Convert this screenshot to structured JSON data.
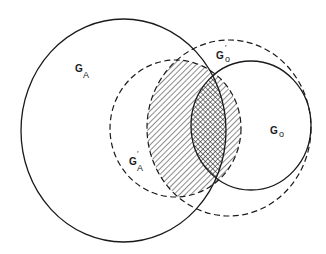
{
  "diagram": {
    "type": "set-overlap",
    "colors": {
      "stroke": "#1a1a1a",
      "background": "#ffffff"
    },
    "sets": [
      {
        "id": "G_A",
        "main": "G",
        "sub": "A",
        "prime": "",
        "style": "solid",
        "cx": 123.5,
        "cy": 130.5,
        "rx": 102.5,
        "ry": 111.5
      },
      {
        "id": "G_A_prime",
        "main": "G",
        "sub": "A",
        "prime": "′",
        "style": "dashed",
        "cx": 175.5,
        "cy": 128.5,
        "rx": 65.5,
        "ry": 68.5
      },
      {
        "id": "G_o",
        "main": "G",
        "sub": "o",
        "prime": "",
        "style": "solid",
        "cx": 251,
        "cy": 125.5,
        "rx": 60,
        "ry": 64.5
      },
      {
        "id": "G_o_prime",
        "main": "G",
        "sub": "o",
        "prime": "′",
        "style": "dashed",
        "cx": 229,
        "cy": 128,
        "rx": 82,
        "ry": 88
      }
    ],
    "regions": [
      {
        "id": "hatched",
        "fill": "diagonal-hatch",
        "intersection_of": [
          "G_A_prime",
          "G_o_prime"
        ]
      },
      {
        "id": "crosshatched",
        "fill": "cross-hatch",
        "intersection_of": [
          "G_A",
          "G_o"
        ]
      }
    ],
    "labels": {
      "G_A": {
        "main": "G",
        "sub": "A"
      },
      "G_A_prime": {
        "main": "G",
        "prime": "′",
        "sub": "A"
      },
      "G_o": {
        "main": "G",
        "sub": "o"
      },
      "G_o_prime": {
        "main": "G",
        "prime": "′",
        "sub": "o"
      }
    }
  }
}
